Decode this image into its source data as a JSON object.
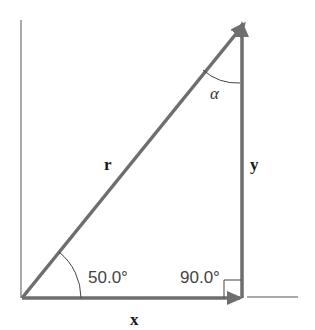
{
  "diagram": {
    "type": "vector-right-triangle",
    "labels": {
      "hypotenuse": "r",
      "horizontal": "x",
      "vertical": "y",
      "top_angle": "α",
      "base_angle": "50.0°",
      "right_angle": "90.0°"
    },
    "colors": {
      "vector": "#6e6e6e",
      "axis": "#555555",
      "arc": "#444444",
      "text": "#1a1a1a"
    }
  }
}
